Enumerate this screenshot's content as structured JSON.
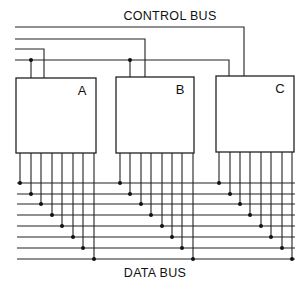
{
  "diagram": {
    "control_bus_label": "CONTROL BUS",
    "data_bus_label": "DATA BUS",
    "colors": {
      "line": "#222222",
      "background": "#ffffff"
    },
    "modules": [
      {
        "id": "A",
        "label": "A",
        "x": 16,
        "y": 78,
        "w": 80,
        "h": 75,
        "outputs_x": [
          20,
          31,
          41,
          52,
          62,
          73,
          83,
          94
        ]
      },
      {
        "id": "B",
        "label": "B",
        "x": 116,
        "y": 77,
        "w": 78,
        "h": 76,
        "outputs_x": [
          120,
          130,
          141,
          151,
          162,
          172,
          182,
          193
        ]
      },
      {
        "id": "C",
        "label": "C",
        "x": 216,
        "y": 76,
        "w": 78,
        "h": 76,
        "outputs_x": [
          219,
          230,
          240,
          250,
          261,
          271,
          282,
          292
        ]
      }
    ],
    "control_lines": [
      {
        "y": 27,
        "x_start": 15,
        "x_end": 244,
        "drops_to": "C"
      },
      {
        "y": 39,
        "x_start": 15,
        "x_end": 145,
        "drops_to": "B"
      },
      {
        "y": 49,
        "x_start": 15,
        "x_end": 44,
        "drops_to": "A"
      },
      {
        "y": 60,
        "x_start": 15,
        "x_end": 229,
        "drops_to": "C",
        "taps": [
          {
            "x": 31,
            "to": "A"
          },
          {
            "x": 130,
            "to": "B"
          }
        ]
      }
    ],
    "data_lines": {
      "x_start": 17,
      "x_end": 295,
      "y": [
        183,
        194,
        204,
        215,
        226,
        237,
        248,
        259
      ]
    }
  }
}
